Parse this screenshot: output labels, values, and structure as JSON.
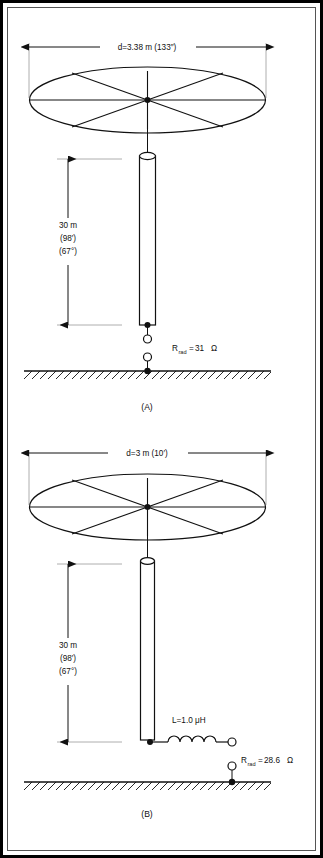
{
  "figure": {
    "kind": "technical-line-diagram",
    "background_color": "#ffffff",
    "line_color": "#111111",
    "border": {
      "outer_color": "#000000",
      "inner_color": "#555555"
    }
  },
  "panels": [
    {
      "id": "A",
      "caption": "(A)",
      "top_dimension": {
        "label": "d=3.38 m (133″)",
        "value": "3.38",
        "unit": "m",
        "alt_value": "133",
        "alt_unit": "in"
      },
      "height_dimension": {
        "line1": "30 m",
        "line2": "(98′)",
        "line3": "(67°)"
      },
      "resistance": {
        "symbol": "R",
        "subscript": "rad",
        "equals": "=",
        "value": "31",
        "unit": "Ω",
        "full_label": "R_rad=31 Ω"
      },
      "has_loading_coil": false,
      "inductor": null
    },
    {
      "id": "B",
      "caption": "(B)",
      "top_dimension": {
        "label": "d=3 m (10′)",
        "value": "3",
        "unit": "m",
        "alt_value": "10",
        "alt_unit": "ft"
      },
      "height_dimension": {
        "line1": "30 m",
        "line2": "(98′)",
        "line3": "(67°)"
      },
      "resistance": {
        "symbol": "R",
        "subscript": "rad",
        "equals": "=",
        "value": "28.6",
        "unit": "Ω",
        "full_label": "R_rad=28.6 Ω"
      },
      "has_loading_coil": true,
      "inductor": {
        "label": "L=1.0 μH",
        "value": "1.0",
        "unit": "μH"
      }
    }
  ]
}
